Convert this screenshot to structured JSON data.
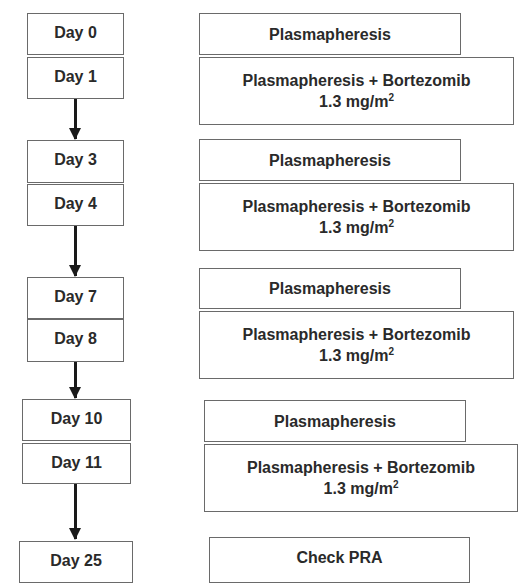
{
  "diagram": {
    "type": "treatment-timeline-flowchart",
    "steps": [
      {
        "day": "Day 0",
        "treatment": "Plasmapheresis"
      },
      {
        "day": "Day 1",
        "treatment": "Plasmapheresis + Bortezomib",
        "dose": "1.3 mg/m",
        "dose_sup": "2"
      },
      {
        "day": "Day 3",
        "treatment": "Plasmapheresis"
      },
      {
        "day": "Day 4",
        "treatment": "Plasmapheresis + Bortezomib",
        "dose": "1.3 mg/m",
        "dose_sup": "2"
      },
      {
        "day": "Day 7",
        "treatment": "Plasmapheresis"
      },
      {
        "day": "Day 8",
        "treatment": "Plasmapheresis + Bortezomib",
        "dose": "1.3 mg/m",
        "dose_sup": "2"
      },
      {
        "day": "Day 10",
        "treatment": "Plasmapheresis"
      },
      {
        "day": "Day 11",
        "treatment": "Plasmapheresis + Bortezomib",
        "dose": "1.3 mg/m",
        "dose_sup": "2"
      },
      {
        "day": "Day 25",
        "treatment": "Check PRA"
      }
    ],
    "colors": {
      "border": "#6a6a6a",
      "arrow": "#1a1a1a",
      "text": "#2a2a2a",
      "background": "#ffffff"
    }
  }
}
